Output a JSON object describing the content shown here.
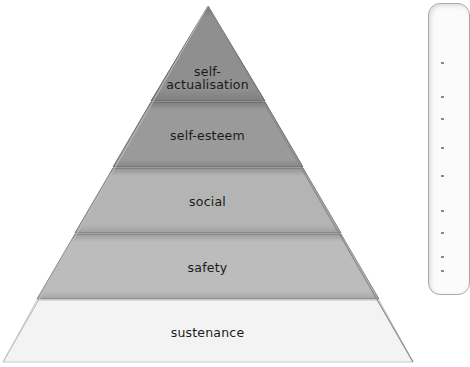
{
  "diagram": {
    "type": "pyramid",
    "levels": [
      {
        "label_line1": "self-",
        "label_line2": "actualisation",
        "fill": "#8f8f8f"
      },
      {
        "label": "self-esteem",
        "fill": "#9a9a9a"
      },
      {
        "label": "social",
        "fill": "#b4b4b4"
      },
      {
        "label": "safety",
        "fill": "#bdbdbd"
      },
      {
        "label": "sustenance",
        "fill": "#f2f2f2"
      }
    ]
  },
  "side_panel": {
    "visible": true
  }
}
